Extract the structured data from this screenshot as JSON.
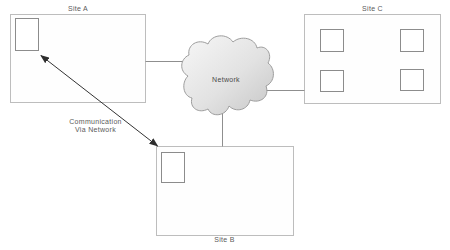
{
  "sites": {
    "a": {
      "label": "Site A",
      "device_count": 1
    },
    "b": {
      "label": "Site B",
      "device_count": 1
    },
    "c": {
      "label": "Site C",
      "device_count": 4
    }
  },
  "cloud": {
    "label": "Network"
  },
  "annotation": {
    "line1": "Communication",
    "line2": "Via Network"
  },
  "colors": {
    "background": "#ffffff",
    "site_border": "#bdbdbd",
    "device_border": "#8c8c8c",
    "connector": "#8f8f8f",
    "arrow": "#333333",
    "cloud_fill_light": "#f6f6f6",
    "cloud_fill_dark": "#c6c6c6",
    "cloud_stroke": "#9d9d9d",
    "label_text": "#5a5a5a"
  }
}
